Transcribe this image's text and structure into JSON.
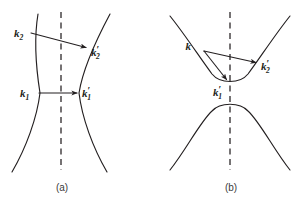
{
  "figure": {
    "background_color": "#ffffff",
    "stroke_color": "#231f20",
    "caption_color": "#3b3b3b",
    "panels": [
      {
        "id": "panel-a",
        "caption": "(a)",
        "caption_pos": {
          "x": 62,
          "y": 191
        },
        "symmetry_axis": {
          "x": 61,
          "y1": 12,
          "y2": 170,
          "style": "dashed"
        },
        "curves": [
          {
            "name": "left-branch",
            "shape": "hyperbola-branch-opening-left",
            "path": "M 38 14 C 33 44 37 74 40 93 C 37 118 26 148 12 172"
          },
          {
            "name": "right-branch",
            "shape": "hyperbola-branch-opening-right",
            "path": "M 110 14 C 94 44 82 74 79 93 C 82 118 93 148 107 172"
          }
        ],
        "vectors": [
          {
            "name": "k2-to-k2prime",
            "from": {
              "x": 31,
              "y": 33
            },
            "to": {
              "x": 88,
              "y": 48
            },
            "angle_deg": 14.8
          },
          {
            "name": "k1-to-k1prime",
            "from": {
              "x": 39,
              "y": 93
            },
            "to": {
              "x": 79,
              "y": 93
            },
            "angle_deg": 0
          }
        ],
        "labels": [
          {
            "name": "label-k2",
            "base": "k",
            "sub": "2",
            "prime": "",
            "x": 14,
            "y": 37
          },
          {
            "name": "label-k2-prime",
            "base": "k",
            "sub": "2",
            "prime": "′",
            "x": 91,
            "y": 58
          },
          {
            "name": "label-k1",
            "base": "k",
            "sub": "1",
            "prime": "",
            "x": 20,
            "y": 97
          },
          {
            "name": "label-k1-prime",
            "base": "k",
            "sub": "1",
            "prime": "′",
            "x": 81,
            "y": 97
          }
        ]
      },
      {
        "id": "panel-b",
        "caption": "(b)",
        "caption_pos": {
          "x": 231,
          "y": 191
        },
        "symmetry_axis": {
          "x": 230,
          "y1": 12,
          "y2": 170,
          "style": "dashed"
        },
        "curves": [
          {
            "name": "upper-branch",
            "shape": "hyperbola-branch-opening-up",
            "path": "M 170 16 C 186 36 200 58 212 74 C 220 84 240 84 248 74 C 260 58 274 36 290 16"
          },
          {
            "name": "lower-branch",
            "shape": "hyperbola-branch-opening-down",
            "path": "M 170 170 C 186 150 200 122 212 111 C 220 102 240 102 248 111 C 260 122 274 150 290 170"
          }
        ],
        "vectors": [
          {
            "name": "k-to-k2prime",
            "from": {
              "x": 204,
              "y": 51
            },
            "to": {
              "x": 258,
              "y": 63
            },
            "angle_deg": 12.5
          },
          {
            "name": "k-to-k1prime",
            "from": {
              "x": 204,
              "y": 51
            },
            "to": {
              "x": 228,
              "y": 82
            },
            "angle_deg": 52.3
          }
        ],
        "labels": [
          {
            "name": "label-k",
            "base": "k",
            "sub": "",
            "prime": "",
            "x": 191,
            "y": 50
          },
          {
            "name": "label-k2-prime",
            "base": "k",
            "sub": "2",
            "prime": "′",
            "x": 261,
            "y": 72
          },
          {
            "name": "label-k1-prime",
            "base": "k",
            "sub": "1",
            "prime": "′",
            "x": 213,
            "y": 96
          }
        ]
      }
    ]
  }
}
